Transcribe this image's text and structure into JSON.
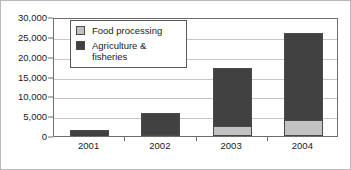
{
  "chart_data": {
    "type": "bar",
    "subtype": "stacked-bar",
    "title": "",
    "subtitle": "",
    "xlabel": "",
    "ylabel": "",
    "categories": [
      "2001",
      "2002",
      "2003",
      "2004"
    ],
    "series": [
      {
        "name": "Food processing",
        "color": "#c2c2c2",
        "values": [
          0,
          400,
          2600,
          4000
        ]
      },
      {
        "name": "Agriculture & fisheries",
        "color": "#414141",
        "values": [
          1400,
          5400,
          14600,
          22000
        ]
      }
    ],
    "totals": [
      1400,
      5800,
      17200,
      26000
    ],
    "ylim": [
      0,
      30000
    ],
    "ytick_values": [
      0,
      5000,
      10000,
      15000,
      20000,
      25000,
      30000
    ],
    "ytick_labels": [
      "0",
      "5,000",
      "10,000",
      "15,000",
      "20,000",
      "25,000",
      "30,000"
    ],
    "grid": true,
    "grid_axis": "y",
    "legend_position": "inside-upper-left",
    "legend_entries": [
      {
        "label": "Food processing",
        "swatch_color": "#c2c2c2"
      },
      {
        "label": "Agriculture &\nfisheries",
        "swatch_color": "#414141"
      }
    ]
  },
  "legend": {
    "items": [
      {
        "label": "Food processing"
      },
      {
        "label_line1": "Agriculture &",
        "label_line2": "fisheries"
      }
    ]
  },
  "axes": {
    "y": {
      "labels": [
        "30,000",
        "25,000",
        "20,000",
        "15,000",
        "10,000",
        "5,000",
        "0"
      ]
    },
    "x": {
      "labels": [
        "2001",
        "2002",
        "2003",
        "2004"
      ]
    }
  },
  "colors": {
    "food_processing": "#c2c2c2",
    "agriculture_fisheries": "#414141",
    "gridline": "#c8c8c8",
    "axis": "#6e6e6e",
    "text": "#1a1a1a",
    "background": "#ffffff"
  }
}
